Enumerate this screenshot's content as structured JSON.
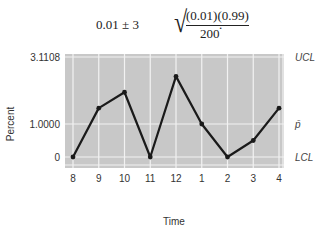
{
  "formula": {
    "lhs": "0.01 ± 3",
    "numerator": "(0.01)(0.99)",
    "denominator": "200",
    "trailing": "."
  },
  "chart_data": {
    "type": "line",
    "title": "",
    "xlabel": "Time",
    "ylabel": "Percent",
    "categories": [
      "8",
      "9",
      "10",
      "11",
      "12",
      "1",
      "2",
      "3",
      "4"
    ],
    "values": [
      0,
      1.5,
      2.0,
      0,
      2.5,
      1.0,
      0,
      0.5,
      1.5
    ],
    "y_ticks": [
      "3.1108",
      "1.0000",
      "0"
    ],
    "y_tick_values": [
      3.1108,
      1.0,
      0
    ],
    "ylim": [
      0,
      3.1108
    ],
    "control_limits": {
      "UCL": 3.1108,
      "p_bar": 1.0,
      "LCL": 0
    },
    "right_labels": [
      "UCL",
      "p̄",
      "LCL"
    ],
    "grid": true,
    "background": "#c8c8c8",
    "line_color": "#1a1a1a",
    "grid_color": "#f2f2f2"
  }
}
